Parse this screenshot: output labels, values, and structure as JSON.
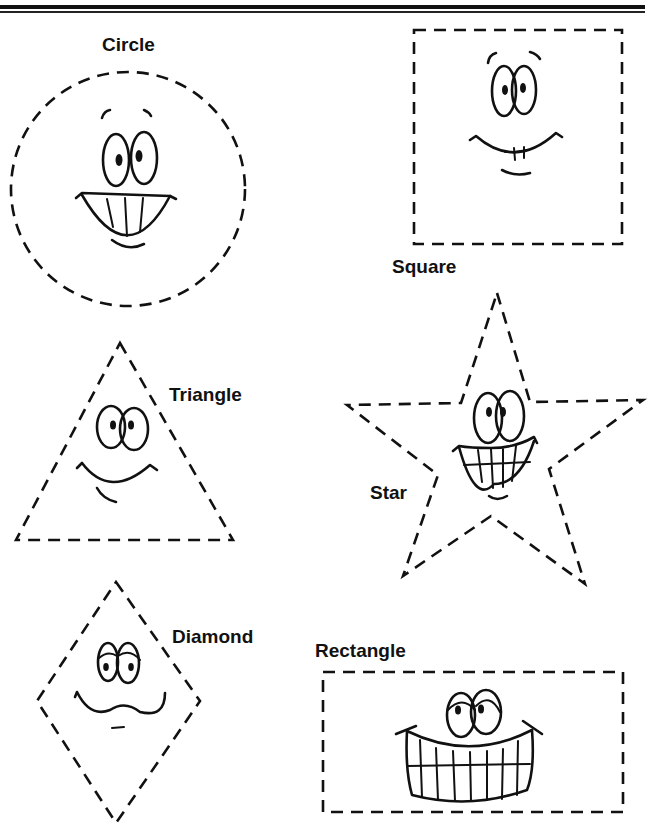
{
  "worksheet": {
    "shapes": [
      {
        "id": "circle",
        "label": "Circle",
        "expression": "grinning-with-teeth"
      },
      {
        "id": "square",
        "label": "Square",
        "expression": "smiling-with-teeth"
      },
      {
        "id": "triangle",
        "label": "Triangle",
        "expression": "smiling"
      },
      {
        "id": "star",
        "label": "Star",
        "expression": "grinning-with-teeth"
      },
      {
        "id": "diamond",
        "label": "Diamond",
        "expression": "wavy-mouth"
      },
      {
        "id": "rectangle",
        "label": "Rectangle",
        "expression": "big-grin-with-teeth"
      }
    ],
    "colors": {
      "ink": "#111111",
      "paper": "#ffffff"
    }
  }
}
